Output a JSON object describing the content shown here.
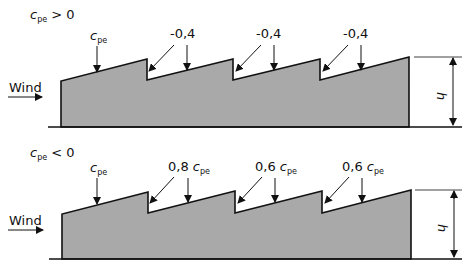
{
  "diagrams": [
    {
      "case_label": {
        "symbol": "c",
        "sub": "pe",
        "rel": " > 0"
      },
      "wind_label": "Wind",
      "height_label": "h",
      "annotations": [
        {
          "type": "cpe",
          "text_symbol": "c",
          "text_sub": "pe"
        },
        {
          "type": "value",
          "text": "-0,4"
        },
        {
          "type": "value",
          "text": "-0,4"
        },
        {
          "type": "value",
          "text": "-0,4"
        }
      ]
    },
    {
      "case_label": {
        "symbol": "c",
        "sub": "pe",
        "rel": " < 0"
      },
      "wind_label": "Wind",
      "height_label": "h",
      "annotations": [
        {
          "type": "cpe",
          "text_symbol": "c",
          "text_sub": "pe"
        },
        {
          "type": "factor",
          "text": "0,8 ",
          "text_symbol": "c",
          "text_sub": "pe"
        },
        {
          "type": "factor",
          "text": "0,6 ",
          "text_symbol": "c",
          "text_sub": "pe"
        },
        {
          "type": "factor",
          "text": "0,6 ",
          "text_symbol": "c",
          "text_sub": "pe"
        }
      ]
    }
  ],
  "colors": {
    "fill": "#a9a9a9",
    "stroke": "#111111"
  }
}
